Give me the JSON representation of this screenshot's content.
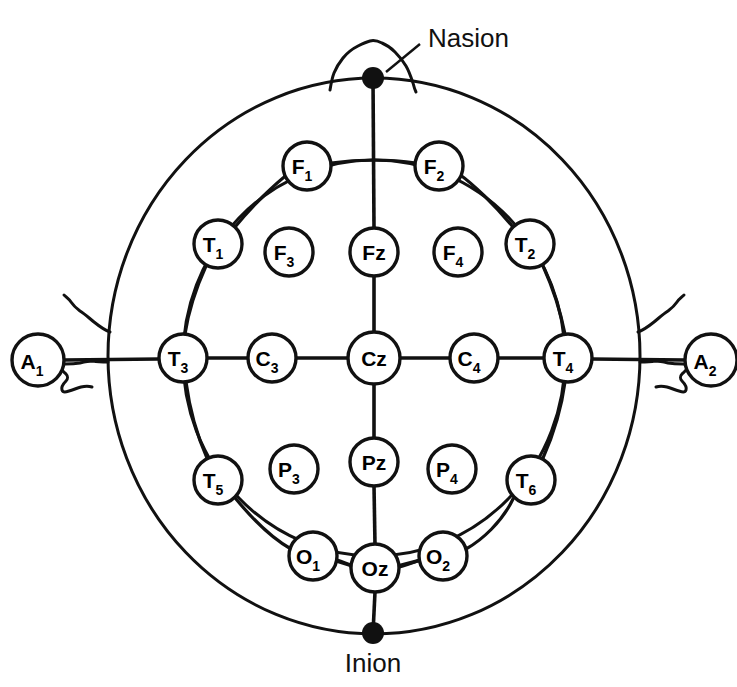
{
  "figure": {
    "title": "",
    "type": "eeg-electrode-placement-diagram",
    "landmarks": [
      {
        "id": "nasion",
        "label": "Nasion",
        "x": 373,
        "y": 78,
        "marker": "filled-dot",
        "label_x": 428,
        "label_y": 47
      },
      {
        "id": "inion",
        "label": "Inion",
        "x": 373,
        "y": 633,
        "marker": "filled-dot",
        "label_x": 373,
        "label_y": 672
      }
    ],
    "ear_electrodes": [
      {
        "id": "A1",
        "base": "A",
        "sub": "1",
        "x": 38,
        "y": 360,
        "r": 26
      },
      {
        "id": "A2",
        "base": "A",
        "sub": "2",
        "x": 711,
        "y": 360,
        "r": 26
      }
    ],
    "electrodes": [
      {
        "id": "F1",
        "base": "F",
        "sub": "1",
        "x": 307,
        "y": 166,
        "r": 24
      },
      {
        "id": "F2",
        "base": "F",
        "sub": "2",
        "x": 439,
        "y": 166,
        "r": 24
      },
      {
        "id": "T1",
        "base": "T",
        "sub": "1",
        "x": 218,
        "y": 244,
        "r": 24
      },
      {
        "id": "F3",
        "base": "F",
        "sub": "3",
        "x": 289,
        "y": 252,
        "r": 24
      },
      {
        "id": "Fz",
        "base": "Fz",
        "sub": "",
        "x": 374,
        "y": 252,
        "r": 24
      },
      {
        "id": "F4",
        "base": "F",
        "sub": "4",
        "x": 458,
        "y": 252,
        "r": 24
      },
      {
        "id": "T2",
        "base": "T",
        "sub": "2",
        "x": 530,
        "y": 244,
        "r": 24
      },
      {
        "id": "T3",
        "base": "T",
        "sub": "3",
        "x": 183,
        "y": 358,
        "r": 24
      },
      {
        "id": "C3",
        "base": "C",
        "sub": "3",
        "x": 272,
        "y": 358,
        "r": 24
      },
      {
        "id": "Cz",
        "base": "Cz",
        "sub": "",
        "x": 374,
        "y": 358,
        "r": 26
      },
      {
        "id": "C4",
        "base": "C",
        "sub": "4",
        "x": 474,
        "y": 358,
        "r": 24
      },
      {
        "id": "T4",
        "base": "T",
        "sub": "4",
        "x": 568,
        "y": 358,
        "r": 24
      },
      {
        "id": "T5",
        "base": "T",
        "sub": "5",
        "x": 218,
        "y": 480,
        "r": 24
      },
      {
        "id": "P3",
        "base": "P",
        "sub": "3",
        "x": 294,
        "y": 469,
        "r": 24
      },
      {
        "id": "Pz",
        "base": "Pz",
        "sub": "",
        "x": 374,
        "y": 462,
        "r": 24
      },
      {
        "id": "P4",
        "base": "P",
        "sub": "4",
        "x": 452,
        "y": 469,
        "r": 24
      },
      {
        "id": "T6",
        "base": "T",
        "sub": "6",
        "x": 531,
        "y": 480,
        "r": 24
      },
      {
        "id": "O1",
        "base": "O",
        "sub": "1",
        "x": 313,
        "y": 556,
        "r": 24
      },
      {
        "id": "Oz",
        "base": "Oz",
        "sub": "",
        "x": 375,
        "y": 568,
        "r": 24
      },
      {
        "id": "O2",
        "base": "O",
        "sub": "2",
        "x": 443,
        "y": 556,
        "r": 24
      }
    ],
    "head_outline": {
      "cx": 374,
      "cy": 356,
      "rx": 266,
      "ry": 278
    },
    "inner_circle": {
      "cx": 374,
      "cy": 358,
      "rx": 191,
      "ry": 198
    },
    "colors": {
      "line": "#111111",
      "fill": "#ffffff",
      "text": "#000000"
    }
  }
}
